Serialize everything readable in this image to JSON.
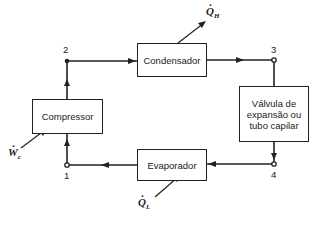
{
  "diagram": {
    "type": "refrigeration-cycle",
    "components": {
      "compressor": "Compressor",
      "condenser": "Condensador",
      "valve_line1": "Válvula de",
      "valve_line2": "expansão ou",
      "valve_line3": "tubo capilar",
      "evaporator": "Evaporador"
    },
    "states": {
      "s1": "1",
      "s2": "2",
      "s3": "3",
      "s4": "4"
    },
    "energy": {
      "QH_symbol": "Q",
      "QH_sub": "H",
      "QL_symbol": "Q",
      "QL_sub": "L",
      "Wc_symbol": "W",
      "Wc_sub": "c"
    },
    "colors": {
      "line": "#222222",
      "background": "#ffffff"
    }
  }
}
